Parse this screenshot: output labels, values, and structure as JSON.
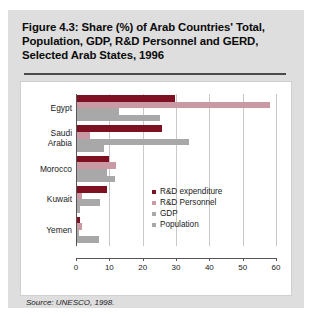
{
  "figure": {
    "title": "Figure 4.3: Share (%) of Arab Countries' Total, Population, GDP, R&D Personnel and GERD, Selected Arab States, 1996",
    "source": "Source: UNESCO, 1998."
  },
  "colors": {
    "rd_expenditure": "#7d1021",
    "rd_personnel": "#c99aa4",
    "gdp": "#a8a8a8",
    "population": "#a8a8a8",
    "panel_background": "#dedede",
    "plot_background": "#ffffff",
    "axis": "#555555",
    "gridline": "#c8c8c8"
  },
  "chart_data": {
    "type": "bar",
    "orientation": "horizontal",
    "title": "Figure 4.3: Share (%) of Arab Countries' Total, Population, GDP, R&D Personnel and GERD, Selected Arab States, 1996",
    "xlabel": "",
    "ylabel": "",
    "xlim": [
      0,
      60
    ],
    "xticks": [
      0,
      10,
      20,
      30,
      40,
      50,
      60
    ],
    "xticklabels": [
      "0",
      "10",
      "20",
      "30",
      "40",
      "50",
      "60"
    ],
    "grid": true,
    "legend_position": "inside-right",
    "categories": [
      "Egypt",
      "Saudi Arabia",
      "Morocco",
      "Kuwait",
      "Yemen"
    ],
    "series": [
      {
        "name": "R&D expenditure",
        "color": "#7d1021",
        "values": [
          29.5,
          25.5,
          9.7,
          8.9,
          1.0
        ]
      },
      {
        "name": "R&D Personnel",
        "color": "#c99aa4",
        "values": [
          58.0,
          4.0,
          11.7,
          1.6,
          1.5
        ]
      },
      {
        "name": "GDP",
        "color": "#a8a8a8",
        "values": [
          12.5,
          33.5,
          9.0,
          7.0,
          0.7
        ]
      },
      {
        "name": "Population",
        "color": "#a8a8a8",
        "values": [
          25.0,
          8.0,
          11.3,
          0.8,
          6.5
        ]
      }
    ]
  }
}
